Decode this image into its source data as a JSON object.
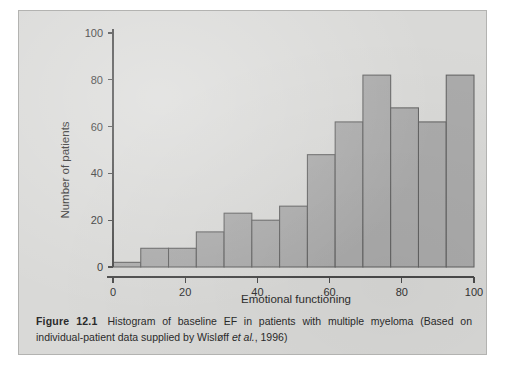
{
  "figure": {
    "panel_bg": "#d9d9d7",
    "caption": {
      "label": "Figure 12.1",
      "text_part1": "Histogram of baseline EF in patients with multiple myeloma (Based on individual-patient data supplied by Wisløff ",
      "italic_part": "et al.",
      "text_part2": ", 1996)"
    }
  },
  "chart_data": {
    "type": "bar",
    "title": "",
    "subtitle": "",
    "xlabel": "Emotional functioning",
    "ylabel": "Number of patients",
    "xlim": [
      0,
      100
    ],
    "ylim": [
      0,
      100
    ],
    "xticks": [
      0,
      20,
      40,
      60,
      80,
      100
    ],
    "xtick_labels": [
      "0",
      "20",
      "40",
      "60",
      "80",
      "100"
    ],
    "yticks": [
      0,
      20,
      40,
      60,
      80,
      100
    ],
    "ytick_labels": [
      "0",
      "20",
      "40",
      "60",
      "80",
      "100"
    ],
    "grid": false,
    "legend": null,
    "bar_fill": "#ababab",
    "bar_edge": "#636363",
    "bin_width": 7.6923,
    "bin_edges": [
      0,
      7.69,
      15.38,
      23.08,
      30.77,
      38.46,
      46.15,
      53.85,
      61.54,
      69.23,
      76.92,
      84.62,
      92.31,
      100
    ],
    "categories": [
      "0-7.7",
      "7.7-15.4",
      "15.4-23.1",
      "23.1-30.8",
      "30.8-38.5",
      "38.5-46.2",
      "46.2-53.8",
      "53.8-61.5",
      "61.5-69.2",
      "69.2-76.9",
      "76.9-84.6",
      "84.6-92.3",
      "92.3-100"
    ],
    "values": [
      2,
      8,
      8,
      15,
      23,
      20,
      26,
      48,
      62,
      82,
      68,
      62,
      82
    ],
    "annotations": []
  }
}
